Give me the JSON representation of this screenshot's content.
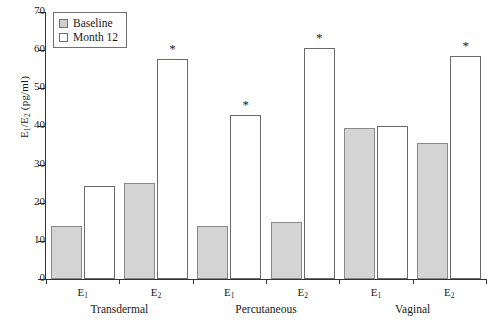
{
  "chart_data": {
    "type": "bar",
    "title": "",
    "xlabel": "",
    "ylabel": "E₁/E₂ (pg/ml)",
    "ylim": [
      0,
      70
    ],
    "yticks": [
      0,
      10,
      20,
      30,
      40,
      50,
      60,
      70
    ],
    "ytick_labels": [
      "0",
      "10",
      "20",
      "30",
      "40",
      "50",
      "60",
      "70"
    ],
    "grid": false,
    "legend_position": "upper-left",
    "categories": [
      "E₁",
      "E₂",
      "E₁",
      "E₂",
      "E₁",
      "E₂"
    ],
    "groups": [
      {
        "name": "Transdermal",
        "categories": [
          "E₁",
          "E₂"
        ]
      },
      {
        "name": "Percutaneous",
        "categories": [
          "E₁",
          "E₂"
        ]
      },
      {
        "name": "Vaginal",
        "categories": [
          "E₁",
          "E₂"
        ]
      }
    ],
    "series": [
      {
        "name": "Baseline",
        "color": "#d4d4d4",
        "values": [
          13.8,
          25.3,
          13.8,
          15.0,
          39.6,
          35.6
        ]
      },
      {
        "name": "Month 12",
        "color": "#ffffff",
        "values": [
          24.5,
          57.8,
          43.0,
          60.5,
          40.0,
          58.4
        ]
      }
    ],
    "annotations": [
      {
        "series": "Month 12",
        "category_index": 1,
        "group": "Transdermal",
        "symbol": "*"
      },
      {
        "series": "Month 12",
        "category_index": 2,
        "group": "Percutaneous",
        "symbol": "*"
      },
      {
        "series": "Month 12",
        "category_index": 3,
        "group": "Percutaneous",
        "symbol": "*"
      },
      {
        "series": "Month 12",
        "category_index": 5,
        "group": "Vaginal",
        "symbol": "*"
      }
    ]
  },
  "legend": {
    "items": [
      {
        "label": "Baseline",
        "swatch": "filled-gray"
      },
      {
        "label": "Month 12",
        "swatch": "open-white"
      }
    ]
  },
  "axis": {
    "y_title_parts": {
      "num": "E",
      "num_sub": "1",
      "den": "E",
      "den_sub": "2",
      "unit": "(pg/ml)"
    }
  }
}
